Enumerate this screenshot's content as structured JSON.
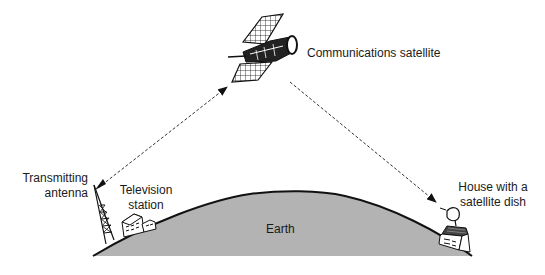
{
  "diagram": {
    "labels": {
      "satellite": "Communications satellite",
      "antenna_line1": "Transmitting",
      "antenna_line2": "antenna",
      "station_line1": "Television",
      "station_line2": "station",
      "house_line1": "House with a",
      "house_line2": "satellite dish",
      "earth": "Earth"
    },
    "colors": {
      "earth_fill": "#b3b3b3",
      "outline": "#111111",
      "background": "#ffffff"
    },
    "arrows": [
      {
        "from": "transmitting-antenna",
        "to": "communications-satellite",
        "style": "dashed",
        "bidirectional": true
      },
      {
        "from": "communications-satellite",
        "to": "house-satellite-dish",
        "style": "dashed",
        "bidirectional": false
      }
    ]
  }
}
